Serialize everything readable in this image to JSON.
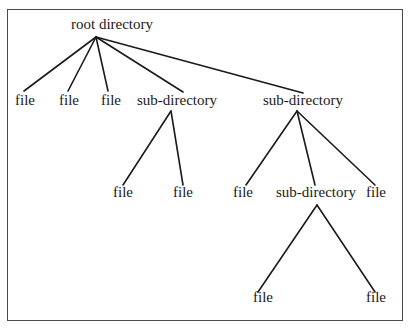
{
  "diagram": {
    "type": "tree",
    "title": "",
    "border_color": "#4a4a4a",
    "line_color": "#1a1a1a",
    "nodes": [
      {
        "id": "root",
        "label": "root directory",
        "x": 112,
        "y": 17
      },
      {
        "id": "f1",
        "label": "file",
        "x": 25,
        "y": 93
      },
      {
        "id": "f2",
        "label": "file",
        "x": 69,
        "y": 93
      },
      {
        "id": "f3",
        "label": "file",
        "x": 111,
        "y": 93
      },
      {
        "id": "sd1",
        "label": "sub-directory",
        "x": 177,
        "y": 93
      },
      {
        "id": "sd2",
        "label": "sub-directory",
        "x": 303,
        "y": 93
      },
      {
        "id": "f4",
        "label": "file",
        "x": 123,
        "y": 185
      },
      {
        "id": "f5",
        "label": "file",
        "x": 183,
        "y": 185
      },
      {
        "id": "f6",
        "label": "file",
        "x": 243,
        "y": 185
      },
      {
        "id": "sd3",
        "label": "sub-directory",
        "x": 316,
        "y": 185
      },
      {
        "id": "f7",
        "label": "file",
        "x": 376,
        "y": 185
      },
      {
        "id": "f8",
        "label": "file",
        "x": 263,
        "y": 290
      },
      {
        "id": "f9",
        "label": "file",
        "x": 376,
        "y": 290
      }
    ],
    "edges": [
      {
        "from": "root",
        "to": "f1",
        "x1": 96,
        "y1": 37,
        "x2": 24,
        "y2": 91
      },
      {
        "from": "root",
        "to": "f2",
        "x1": 96,
        "y1": 37,
        "x2": 68,
        "y2": 91
      },
      {
        "from": "root",
        "to": "f3",
        "x1": 96,
        "y1": 37,
        "x2": 108,
        "y2": 91
      },
      {
        "from": "root",
        "to": "sd1",
        "x1": 96,
        "y1": 37,
        "x2": 183,
        "y2": 92
      },
      {
        "from": "root",
        "to": "sd2",
        "x1": 96,
        "y1": 37,
        "x2": 303,
        "y2": 93
      },
      {
        "from": "sd1",
        "to": "f4",
        "x1": 171,
        "y1": 111,
        "x2": 123,
        "y2": 185
      },
      {
        "from": "sd1",
        "to": "f5",
        "x1": 171,
        "y1": 111,
        "x2": 183,
        "y2": 185
      },
      {
        "from": "sd2",
        "to": "f6",
        "x1": 297,
        "y1": 111,
        "x2": 246,
        "y2": 185
      },
      {
        "from": "sd2",
        "to": "sd3",
        "x1": 297,
        "y1": 111,
        "x2": 315,
        "y2": 185
      },
      {
        "from": "sd2",
        "to": "f7",
        "x1": 297,
        "y1": 111,
        "x2": 375,
        "y2": 185
      },
      {
        "from": "sd3",
        "to": "f8",
        "x1": 317,
        "y1": 205,
        "x2": 258,
        "y2": 292
      },
      {
        "from": "sd3",
        "to": "f9",
        "x1": 317,
        "y1": 205,
        "x2": 375,
        "y2": 292
      }
    ]
  }
}
